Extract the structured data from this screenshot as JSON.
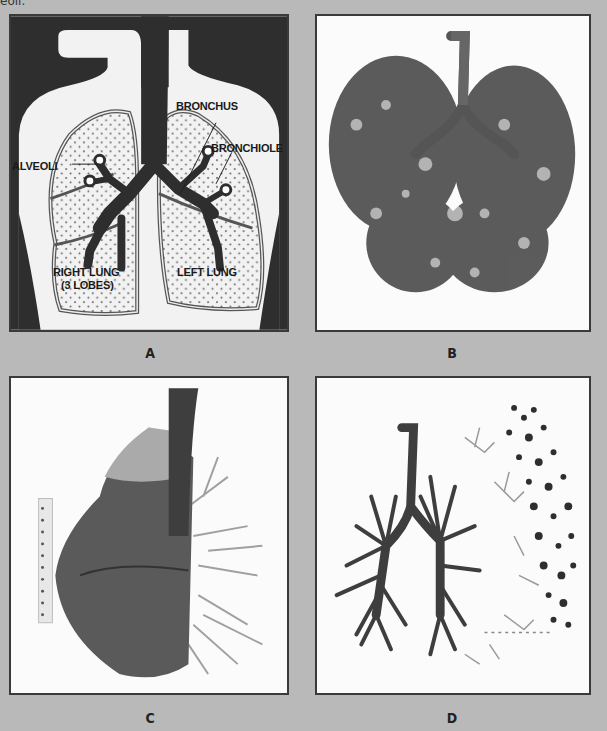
{
  "header": {
    "clipped_text": "eoli."
  },
  "panels": [
    {
      "id": "A",
      "caption": "A",
      "type": "illustration",
      "labels": {
        "bronchus": "BRONCHUS",
        "alveoli": "ALVEOLI",
        "bronchiole": "BRONCHIOLE",
        "right_lung_line1": "RIGHT LUNG",
        "right_lung_line2": "(3 LOBES)",
        "left_lung": "LEFT LUNG"
      }
    },
    {
      "id": "B",
      "caption": "B",
      "type": "photo",
      "subject": "bronchial tree cast"
    },
    {
      "id": "C",
      "caption": "C",
      "type": "photo",
      "subject": "lung lobe cast with ruler"
    },
    {
      "id": "D",
      "caption": "D",
      "type": "photo",
      "subject": "dissected bronchial tree with bronchioles and alveoli"
    }
  ],
  "colors": {
    "background": "#b9b9b9",
    "frame": "#3a3a3a",
    "dark_fill": "#2e2e2e",
    "cast_gray": "#4a4a4a"
  }
}
